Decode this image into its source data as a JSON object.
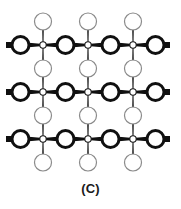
{
  "figure": {
    "caption": "(C)",
    "title": "",
    "width": 181,
    "height": 209,
    "background_color": "#ffffff"
  },
  "chart_data": {
    "type": "diagram",
    "title": "",
    "subtitle": "",
    "xlabel": "",
    "ylabel": "",
    "grid": false,
    "legend": null,
    "annotations": [
      "(C)"
    ],
    "lattice": {
      "rows": 3,
      "cols": 3,
      "center_x": [
        43,
        88,
        133
      ],
      "center_y": [
        45,
        92,
        139
      ],
      "spacing_x": 45,
      "spacing_y": 47,
      "metal_node": {
        "label": "metal-center",
        "radius": 3.2,
        "fill": "#ffffff",
        "stroke": "#1a1a1a",
        "stroke_width": 1.1
      },
      "horizontal_ligand": {
        "label": "bridging-ligand-horizontal",
        "radius": 8.5,
        "fill": "#ffffff",
        "stroke": "#101010",
        "stroke_width": 3.0
      },
      "vertical_ligand": {
        "label": "bridging-ligand-vertical",
        "radius": 8.5,
        "fill": "#ffffff",
        "stroke": "#8a8a8a",
        "stroke_width": 1.2
      },
      "horizontal_bond": {
        "label": "bond-horizontal",
        "color": "#101010",
        "outer_half_width": 3.0,
        "inner_half_width": 0.9
      },
      "vertical_bond": {
        "label": "bond-vertical",
        "color": "#4a4a4a",
        "outer_half_width": 1.2,
        "inner_half_width": 0.6
      },
      "terminal_stub": {
        "label": "terminal-bond-stub",
        "length": 6,
        "color": "#101010"
      }
    }
  }
}
